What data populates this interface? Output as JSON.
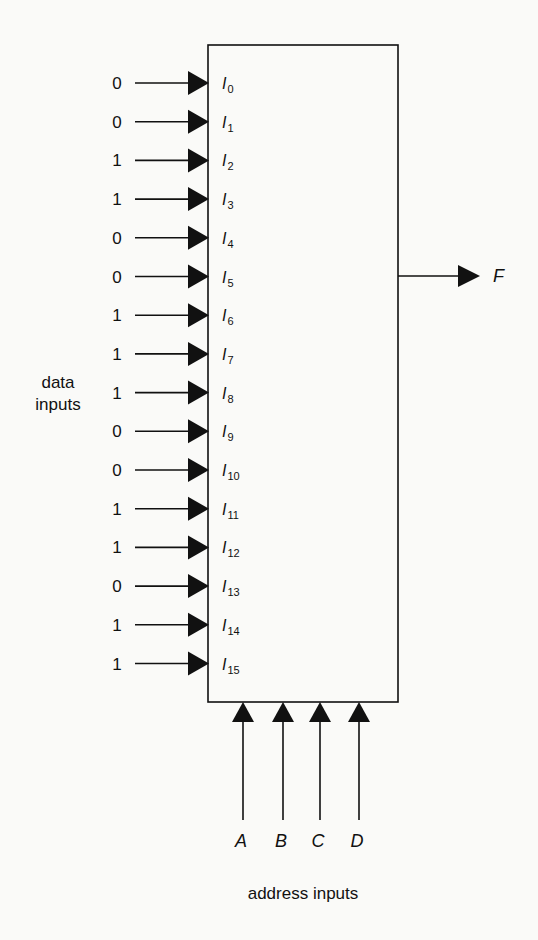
{
  "diagram": {
    "type": "multiplexer",
    "box": {
      "x": 208,
      "y": 45,
      "width": 190,
      "height": 657
    },
    "data_inputs_label": [
      "data",
      "inputs"
    ],
    "data_inputs": [
      {
        "name": "I",
        "index": "0",
        "value": "0"
      },
      {
        "name": "I",
        "index": "1",
        "value": "0"
      },
      {
        "name": "I",
        "index": "2",
        "value": "1"
      },
      {
        "name": "I",
        "index": "3",
        "value": "1"
      },
      {
        "name": "I",
        "index": "4",
        "value": "0"
      },
      {
        "name": "I",
        "index": "5",
        "value": "0"
      },
      {
        "name": "I",
        "index": "6",
        "value": "1"
      },
      {
        "name": "I",
        "index": "7",
        "value": "1"
      },
      {
        "name": "I",
        "index": "8",
        "value": "1"
      },
      {
        "name": "I",
        "index": "9",
        "value": "0"
      },
      {
        "name": "I",
        "index": "10",
        "value": "0"
      },
      {
        "name": "I",
        "index": "11",
        "value": "1"
      },
      {
        "name": "I",
        "index": "12",
        "value": "1"
      },
      {
        "name": "I",
        "index": "13",
        "value": "0"
      },
      {
        "name": "I",
        "index": "14",
        "value": "1"
      },
      {
        "name": "I",
        "index": "15",
        "value": "1"
      }
    ],
    "output": {
      "label": "F"
    },
    "address_inputs": [
      "A",
      "B",
      "C",
      "D"
    ],
    "address_inputs_label": "address inputs",
    "colors": {
      "line": "#111111",
      "background": "#fafaf8"
    }
  }
}
